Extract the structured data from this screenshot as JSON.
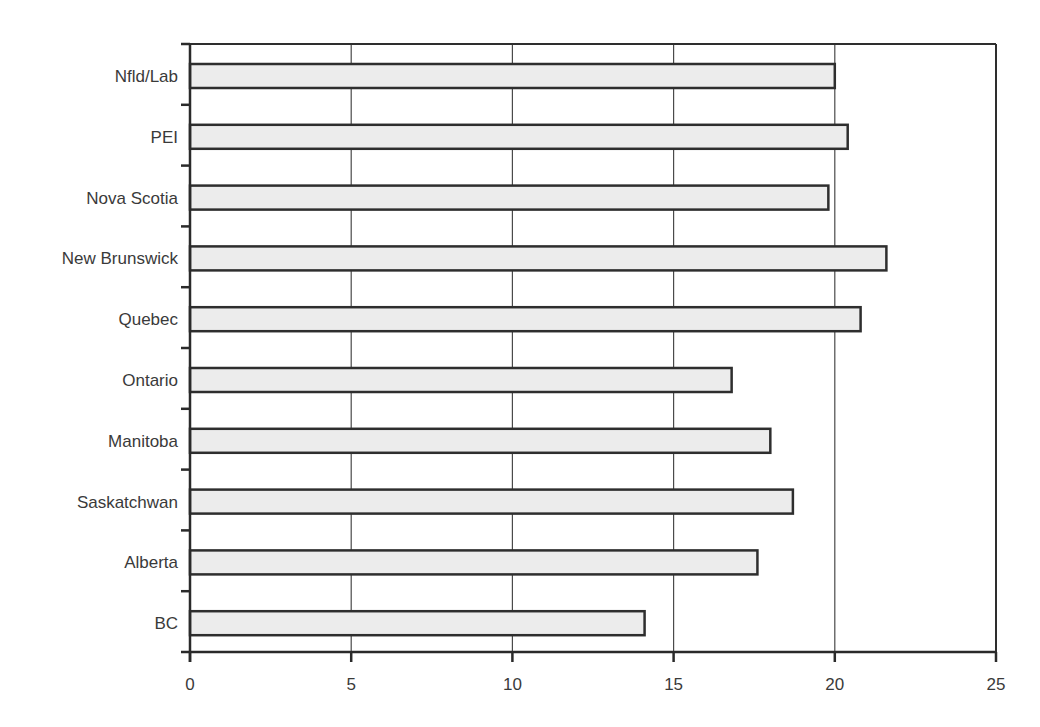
{
  "chart_data": {
    "type": "bar",
    "orientation": "horizontal",
    "title": "",
    "xlabel": "",
    "ylabel": "",
    "categories": [
      "Nfld/Lab",
      "PEI",
      "Nova Scotia",
      "New Brunswick",
      "Quebec",
      "Ontario",
      "Manitoba",
      "Saskatchwan",
      "Alberta",
      "BC"
    ],
    "values": [
      20.0,
      20.4,
      19.8,
      21.6,
      20.8,
      16.8,
      18.0,
      18.7,
      17.6,
      14.1
    ],
    "xlim": [
      0,
      25
    ],
    "x_ticks": [
      0,
      5,
      10,
      15,
      20,
      25
    ],
    "x_tick_labels": [
      "0",
      "5",
      "10",
      "15",
      "20",
      "25"
    ],
    "grid": "vertical",
    "legend": null
  },
  "colors": {
    "bar_fill": "#ececec",
    "bar_stroke": "#2e2e2e",
    "gridline": "#4a4a4a",
    "text": "#3a3a3a"
  }
}
